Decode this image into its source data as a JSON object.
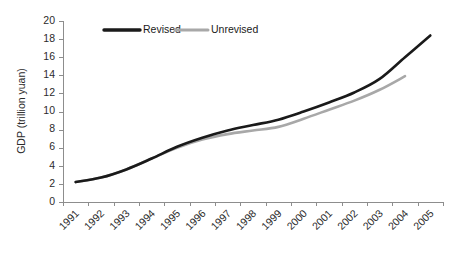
{
  "chart_data": {
    "type": "line",
    "title": "",
    "subtitle": "",
    "xlabel": "",
    "ylabel": "GDP (trillion yuan)",
    "categories": [
      "1991",
      "1992",
      "1993",
      "1994",
      "1995",
      "1996",
      "1997",
      "1998",
      "1999",
      "2000",
      "2001",
      "2002",
      "2003",
      "2004",
      "2005"
    ],
    "x": [
      1991,
      1992,
      1993,
      1994,
      1995,
      1996,
      1997,
      1998,
      1999,
      2000,
      2001,
      2002,
      2003,
      2004,
      2005
    ],
    "series": [
      {
        "name": "Revised",
        "color": "#1a1a1a",
        "values": [
          2.2,
          2.7,
          3.6,
          4.8,
          6.1,
          7.1,
          7.9,
          8.5,
          9.1,
          10.0,
          11.0,
          12.1,
          13.6,
          16.0,
          18.4
        ]
      },
      {
        "name": "Unrevised",
        "color": "#a8a8a8",
        "values": [
          2.2,
          2.7,
          3.6,
          4.8,
          6.0,
          6.9,
          7.5,
          7.9,
          8.3,
          9.2,
          10.2,
          11.2,
          12.4,
          13.9,
          null
        ]
      }
    ],
    "ylim": [
      0,
      20
    ],
    "yticks": [
      0,
      2,
      4,
      6,
      8,
      10,
      12,
      14,
      16,
      18,
      20
    ],
    "ytick_labels": [
      "0",
      "2",
      "4",
      "6",
      "8",
      "10",
      "12",
      "14",
      "16",
      "18",
      "20"
    ],
    "grid": false,
    "legend_position": "top-center",
    "legend_entries": [
      "Revised",
      "Unrevised"
    ],
    "annotations": []
  },
  "axes": {
    "y_title": "GDP (trillion yuan)",
    "y_tick_labels": [
      "20",
      "18",
      "16",
      "14",
      "12",
      "10",
      "8",
      "6",
      "4",
      "2",
      "0"
    ],
    "x_tick_labels": [
      "1991",
      "1992",
      "1993",
      "1994",
      "1995",
      "1996",
      "1997",
      "1998",
      "1999",
      "2000",
      "2001",
      "2002",
      "2003",
      "2004",
      "2005"
    ]
  },
  "legend": {
    "items": [
      {
        "label": "Revised",
        "color": "#1a1a1a"
      },
      {
        "label": "Unrevised",
        "color": "#a8a8a8"
      }
    ]
  },
  "colors": {
    "revised": "#1a1a1a",
    "unrevised": "#a8a8a8",
    "axis": "#8d8d8d",
    "text": "#2b2b2b",
    "background": "#ffffff"
  }
}
